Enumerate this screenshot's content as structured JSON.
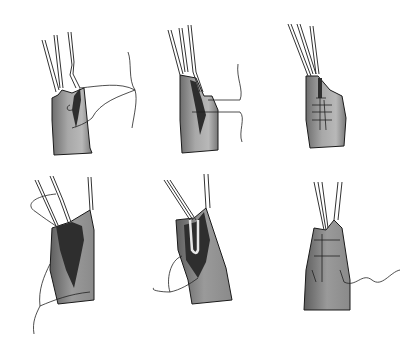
{
  "figure": {
    "type": "surgical-illustration",
    "layout": {
      "rows": 2,
      "columns": 3
    },
    "panels": [
      {
        "index": 1,
        "row": 1,
        "col": 1,
        "content": "vessel with three branches, open incision, suture thread looped with needle"
      },
      {
        "index": 2,
        "row": 1,
        "col": 2,
        "content": "vessel with tissue flap folded, suture passed through"
      },
      {
        "index": 3,
        "row": 1,
        "col": 3,
        "content": "vessel with incision closed by running sutures"
      },
      {
        "index": 4,
        "row": 2,
        "col": 1,
        "content": "vessel opened widely showing dark interior, suture with knot"
      },
      {
        "index": 5,
        "row": 2,
        "col": 2,
        "content": "vessel opened with looped branch inserted, suture with knot"
      },
      {
        "index": 6,
        "row": 2,
        "col": 3,
        "content": "vessel closed with sutures, single thread trailing"
      }
    ],
    "colors": {
      "background": "#ffffff",
      "tissue_light": "#b0b0b0",
      "tissue_dark": "#5a5a5a",
      "lumen": "#2e2e2e",
      "outline": "#1a1a1a"
    }
  }
}
